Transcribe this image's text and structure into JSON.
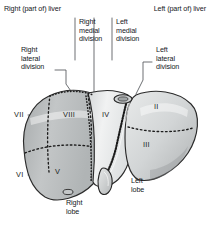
{
  "figure": {
    "background_color": "#ffffff",
    "text_color": "#15181c"
  },
  "headers": {
    "right_liver": "Right (part of) liver",
    "left_liver": "Left (part of) liver"
  },
  "divisions": {
    "right_lateral": "Right\nlateral\ndivision",
    "right_medial": "Right\nmedial\ndivision",
    "left_medial": "Left\nmedial\ndivision",
    "left_lateral": "Left\nlateral\ndivision"
  },
  "lobes": {
    "right_lobe": "Right\nlobe",
    "left_lobe": "Left\nlobe"
  },
  "segments": [
    {
      "label": "VII",
      "x": 14,
      "y": 111
    },
    {
      "label": "VIII",
      "x": 63,
      "y": 111
    },
    {
      "label": "IV",
      "x": 102,
      "y": 111
    },
    {
      "label": "II",
      "x": 154,
      "y": 103
    },
    {
      "label": "III",
      "x": 143,
      "y": 141
    },
    {
      "label": "VI",
      "x": 16,
      "y": 171
    },
    {
      "label": "V",
      "x": 55,
      "y": 168
    }
  ],
  "colors": {
    "outline": "#2b2b2b",
    "right_lobe_fill": "#b9bcbd",
    "mid_lobe_fill": "#e3e5e5",
    "left_lobe_fill": "#d3d6d7",
    "segment_dash": "#1c1c1c",
    "leader_line": "#4a4d50",
    "ligament": "#1a1a1a"
  }
}
